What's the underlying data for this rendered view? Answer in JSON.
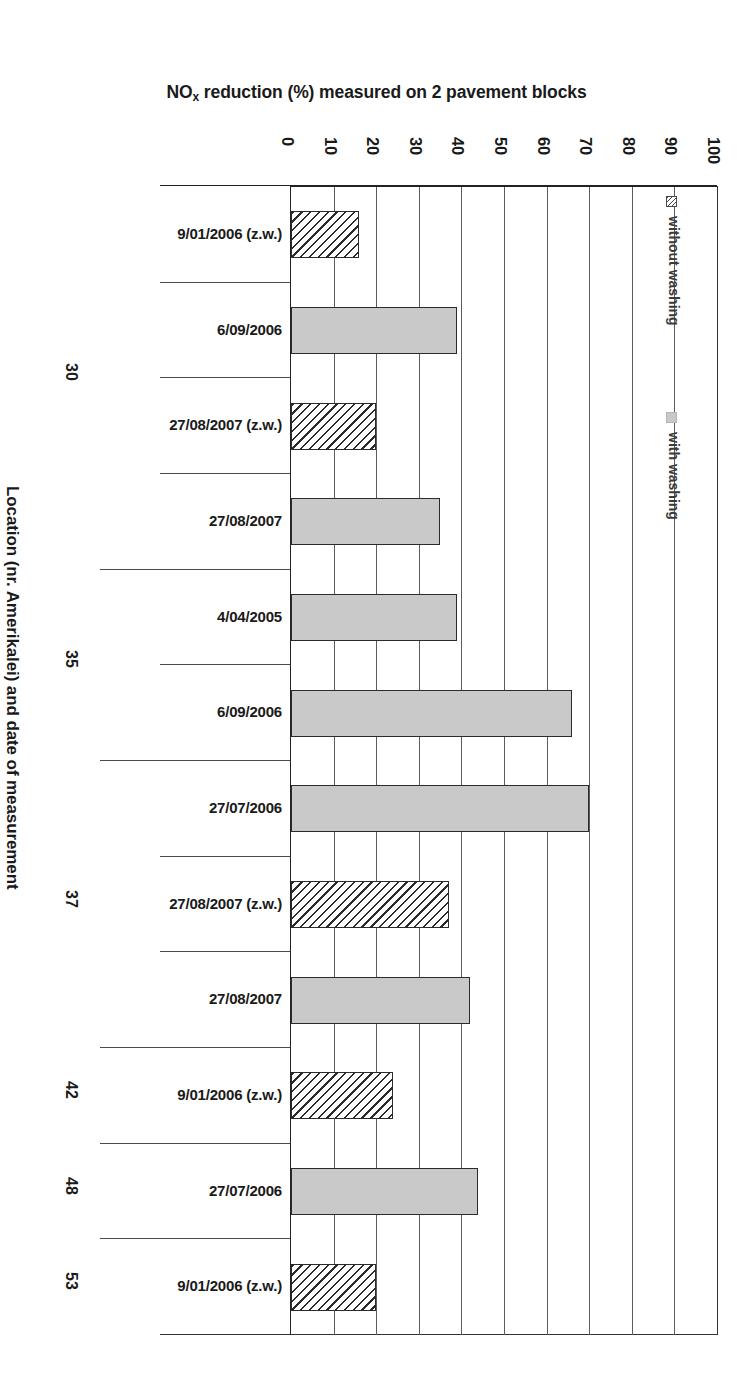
{
  "chart_data": {
    "type": "bar",
    "orientation": "horizontal",
    "title_prefix": "NO",
    "title_sub": "x",
    "title_suffix": " reduction (%) measured on 2 pavement blocks",
    "title": "NOx reduction (%) measured on 2 pavement blocks",
    "xlabel": "NOx reduction (%) measured on 2 pavement blocks",
    "ylabel": "Location (nr. Amerikalei) and date of measurement",
    "xlim": [
      0,
      100
    ],
    "xticks": [
      "0",
      "10",
      "20",
      "30",
      "40",
      "50",
      "60",
      "70",
      "80",
      "90",
      "100"
    ],
    "grid": "vertical-only",
    "legend_position": "inside-right",
    "legend": [
      {
        "label": "without washing",
        "swatch": "hatched"
      },
      {
        "label": "with washing",
        "swatch": "solid-gray"
      }
    ],
    "series": [
      {
        "name": "without washing",
        "pattern": "hatched",
        "color": "#ffffff"
      },
      {
        "name": "with washing",
        "pattern": "solid",
        "color": "#c9c9c9"
      }
    ],
    "categories": [
      "9/01/2006 (z.w.)",
      "6/09/2006",
      "27/08/2007 (z.w.)",
      "27/08/2007",
      "4/04/2005",
      "6/09/2006",
      "27/07/2006",
      "27/08/2007 (z.w.)",
      "27/08/2007",
      "9/01/2006 (z.w.)",
      "27/07/2006",
      "9/01/2006 (z.w.)"
    ],
    "values": [
      16,
      39,
      20,
      35,
      39,
      66,
      70,
      37,
      42,
      24,
      44,
      20
    ],
    "bars": [
      {
        "category": "9/01/2006 (z.w.)",
        "value": 16,
        "series": "without washing"
      },
      {
        "category": "6/09/2006",
        "value": 39,
        "series": "with washing"
      },
      {
        "category": "27/08/2007 (z.w.)",
        "value": 20,
        "series": "without washing"
      },
      {
        "category": "27/08/2007",
        "value": 35,
        "series": "with washing"
      },
      {
        "category": "4/04/2005",
        "value": 39,
        "series": "with washing"
      },
      {
        "category": "6/09/2006",
        "value": 66,
        "series": "with washing"
      },
      {
        "category": "27/07/2006",
        "value": 70,
        "series": "with washing"
      },
      {
        "category": "27/08/2007 (z.w.)",
        "value": 37,
        "series": "without washing"
      },
      {
        "category": "27/08/2007",
        "value": 42,
        "series": "with washing"
      },
      {
        "category": "9/01/2006 (z.w.)",
        "value": 24,
        "series": "without washing"
      },
      {
        "category": "27/07/2006",
        "value": 44,
        "series": "with washing"
      },
      {
        "category": "9/01/2006 (z.w.)",
        "value": 20,
        "series": "without washing"
      }
    ],
    "location_groups": [
      {
        "label": "30",
        "categories": [
          "9/01/2006 (z.w.)",
          "6/09/2006",
          "27/08/2007 (z.w.)",
          "27/08/2007"
        ]
      },
      {
        "label": "35",
        "categories": [
          "4/04/2005",
          "6/09/2006"
        ]
      },
      {
        "label": "37",
        "categories": [
          "27/07/2006",
          "27/08/2007 (z.w.)",
          "27/08/2007"
        ]
      },
      {
        "label": "42",
        "categories": [
          "9/01/2006 (z.w.)"
        ]
      },
      {
        "label": "48",
        "categories": [
          "27/07/2006"
        ]
      },
      {
        "label": "53",
        "categories": [
          "9/01/2006 (z.w.)"
        ]
      }
    ]
  },
  "axis": {
    "value_ticks": [
      "0",
      "10",
      "20",
      "30",
      "40",
      "50",
      "60",
      "70",
      "80",
      "90",
      "100"
    ],
    "category_axis_title": "Location (nr. Amerikalei) and date of measurement"
  },
  "legend": {
    "without_washing": "without washing",
    "with_washing": "with washing"
  },
  "groups": {
    "g0": "30",
    "g1": "35",
    "g2": "37",
    "g3": "42",
    "g4": "48",
    "g5": "53"
  },
  "categories": {
    "c0": "9/01/2006 (z.w.)",
    "c1": "6/09/2006",
    "c2": "27/08/2007 (z.w.)",
    "c3": "27/08/2007",
    "c4": "4/04/2005",
    "c5": "6/09/2006",
    "c6": "27/07/2006",
    "c7": "27/08/2007 (z.w.)",
    "c8": "27/08/2007",
    "c9": "9/01/2006 (z.w.)",
    "c10": "27/07/2006",
    "c11": "9/01/2006 (z.w.)"
  },
  "title": {
    "prefix": "NO",
    "sub": "x",
    "suffix": " reduction (%) measured on 2 pavement blocks"
  },
  "colors": {
    "bar_with_washing": "#c9c9c9",
    "bar_outline": "#2b2b2b",
    "gridline": "#5b5b5b",
    "axis": "#222222",
    "text": "#1a1a1a"
  }
}
